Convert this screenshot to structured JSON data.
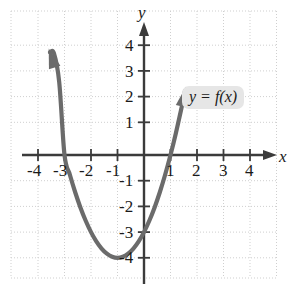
{
  "figure": {
    "background_color": "#ffffff",
    "curve_color": "#666666",
    "axis_color": "#3b3b3b",
    "grid_color": "#cfcfcf",
    "label_background": "#e6e6e6"
  },
  "axes": {
    "x_name": "x",
    "y_name": "y",
    "x_ticks": [
      "-4",
      "-3",
      "-2",
      "-1",
      "1",
      "2",
      "3",
      "4"
    ],
    "y_ticks": [
      "4",
      "3",
      "2",
      "1",
      "-1",
      "-2",
      "-3",
      "-4"
    ],
    "x_tick_values": [
      -4,
      -3,
      -2,
      -1,
      1,
      2,
      3,
      4
    ],
    "y_tick_values": [
      4,
      3,
      2,
      1,
      -1,
      -2,
      -3,
      -4
    ],
    "minus_glyph": "−"
  },
  "annotations": {
    "curve_label": "y = f(x)"
  },
  "chart_data": {
    "type": "line",
    "title": "",
    "xlabel": "x",
    "ylabel": "y",
    "xlim": [
      -5.0,
      5.1
    ],
    "ylim": [
      -5.0,
      5.0
    ],
    "grid": true,
    "grid_style": "dotted",
    "legend": "none",
    "series": [
      {
        "name": "y = f(x)",
        "equation": "f(x) = x^2 + 2x - 3",
        "vertex": [
          -1,
          -4
        ],
        "x_intercepts": [
          -3,
          1
        ],
        "y_intercept": -3,
        "arrow_start": true,
        "arrow_end": true,
        "x": [
          -3.55,
          -3.4,
          -3.2,
          -3,
          -2.8,
          -2.6,
          -2.4,
          -2.2,
          -2,
          -1.8,
          -1.6,
          -1.4,
          -1.2,
          -1,
          -0.8,
          -0.6,
          -0.4,
          -0.2,
          0,
          0.2,
          0.4,
          0.6,
          0.8,
          1,
          1.2,
          1.4,
          1.55
        ],
        "y": [
          4.0,
          3.96,
          2.84,
          0.0,
          -0.76,
          -1.44,
          -2.04,
          -2.56,
          -3.0,
          -3.36,
          -3.64,
          -3.84,
          -3.96,
          -4.0,
          -3.96,
          -3.84,
          -3.64,
          -3.36,
          -3.0,
          -2.56,
          -2.04,
          -1.44,
          -0.76,
          0.0,
          0.84,
          1.76,
          2.5
        ]
      }
    ]
  }
}
